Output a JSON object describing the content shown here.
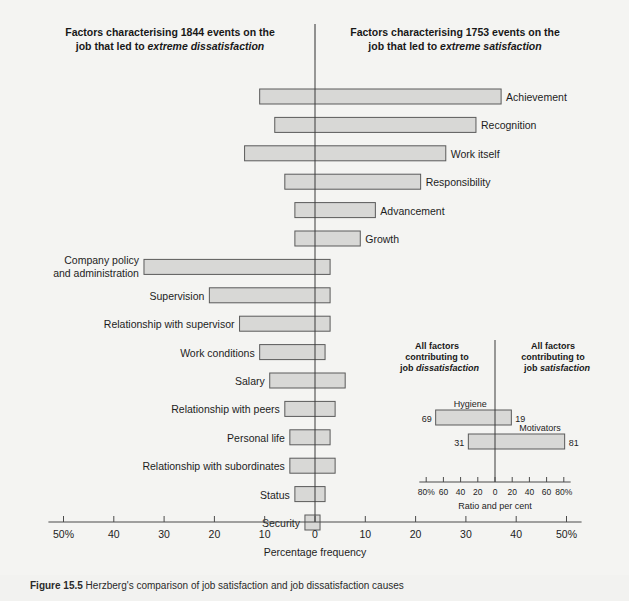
{
  "figure": {
    "caption_label": "Figure 15.5",
    "caption_text": "Herzberg's comparison of job satisfaction and job dissatisfaction causes"
  },
  "headers": {
    "left_line1": "Factors characterising 1844 events on the",
    "left_line2_plain": "job that led to ",
    "left_line2_italic": "extreme dissatisfaction",
    "right_line1": "Factors characterising 1753 events on the",
    "right_line2_plain": "job that led to ",
    "right_line2_italic": "extreme satisfaction"
  },
  "axis": {
    "title": "Percentage frequency",
    "tick_labels": [
      "50%",
      "40",
      "30",
      "20",
      "10",
      "0",
      "10",
      "20",
      "30",
      "40",
      "50%"
    ],
    "tick_values": [
      -50,
      -40,
      -30,
      -20,
      -10,
      0,
      10,
      20,
      30,
      40,
      50
    ],
    "min": -53,
    "max": 53
  },
  "inset": {
    "title_left_line1": "All factors",
    "title_left_line2": "contributing to",
    "title_left_line3_plain": "job ",
    "title_left_line3_italic": "dissatisfaction",
    "title_right_line1": "All factors",
    "title_right_line2": "contributing to",
    "title_right_line3_plain": "job ",
    "title_right_line3_italic": "satisfaction",
    "axis_title": "Ratio and per cent",
    "tick_labels": [
      "80%",
      "60",
      "40",
      "20",
      "0",
      "20",
      "40",
      "60",
      "80%"
    ],
    "tick_values": [
      -80,
      -60,
      -40,
      -20,
      0,
      20,
      40,
      60,
      80
    ],
    "min": -88,
    "max": 88,
    "bars": [
      {
        "name": "Hygiene",
        "left": 69,
        "right": 19,
        "left_label": "69",
        "right_label": "19",
        "name_side": "left"
      },
      {
        "name": "Motivators",
        "left": 31,
        "right": 81,
        "left_label": "31",
        "right_label": "81",
        "name_side": "right"
      }
    ]
  },
  "colors": {
    "page_background": "#f2f2f0",
    "panel_background": "#f4f4f2",
    "bar_fill": "#d8d8d6",
    "bar_stroke": "#5a5a5a",
    "axis": "#4a4a4a",
    "text": "#1d1d1d"
  },
  "chart_data": {
    "type": "bar",
    "orientation": "horizontal-diverging",
    "title": "Herzberg's comparison of job satisfaction and job dissatisfaction causes",
    "xlabel": "Percentage frequency",
    "ylabel": "",
    "xlim": [
      -53,
      53
    ],
    "grid": false,
    "legend": "none",
    "note": "Negative values extend left of zero (dissatisfaction); positive values extend right of zero (satisfaction).",
    "categories": [
      "Achievement",
      "Recognition",
      "Work itself",
      "Responsibility",
      "Advancement",
      "Growth",
      "Company policy and administration",
      "Supervision",
      "Relationship with supervisor",
      "Work conditions",
      "Salary",
      "Relationship with peers",
      "Personal life",
      "Relationship with subordinates",
      "Status",
      "Security"
    ],
    "series": [
      {
        "name": "Dissatisfaction (left of zero, %)",
        "values": [
          11,
          8,
          14,
          6,
          4,
          4,
          34,
          21,
          15,
          11,
          9,
          6,
          5,
          5,
          4,
          2
        ]
      },
      {
        "name": "Satisfaction (right of zero, %)",
        "values": [
          37,
          32,
          26,
          21,
          12,
          9,
          3,
          3,
          3,
          2,
          6,
          4,
          3,
          4,
          2,
          1
        ]
      }
    ],
    "category_label_side": [
      "right",
      "right",
      "right",
      "right",
      "right",
      "right",
      "left",
      "left",
      "left",
      "left",
      "left",
      "left",
      "left",
      "left",
      "left",
      "left"
    ],
    "inset_chart": {
      "type": "bar",
      "orientation": "horizontal-diverging",
      "xlabel": "Ratio and per cent",
      "xlim": [
        -88,
        88
      ],
      "categories": [
        "Hygiene",
        "Motivators"
      ],
      "series": [
        {
          "name": "Contributing to job dissatisfaction (%)",
          "values": [
            69,
            31
          ]
        },
        {
          "name": "Contributing to job satisfaction (%)",
          "values": [
            19,
            81
          ]
        }
      ]
    }
  }
}
